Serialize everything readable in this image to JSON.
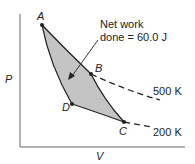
{
  "diagram": {
    "type": "PV diagram",
    "axes": {
      "y_label": "P",
      "x_label": "V"
    },
    "points": [
      {
        "name": "A"
      },
      {
        "name": "B"
      },
      {
        "name": "C"
      },
      {
        "name": "D"
      }
    ],
    "isotherms": [
      {
        "label": "500 K"
      },
      {
        "label": "200 K"
      }
    ],
    "annotation": {
      "line1": "Net work",
      "line2": "done = 60.0 J"
    },
    "colors": {
      "fill": "#c4c4c4",
      "stroke": "#222222",
      "axis": "#9a9a9a"
    }
  }
}
